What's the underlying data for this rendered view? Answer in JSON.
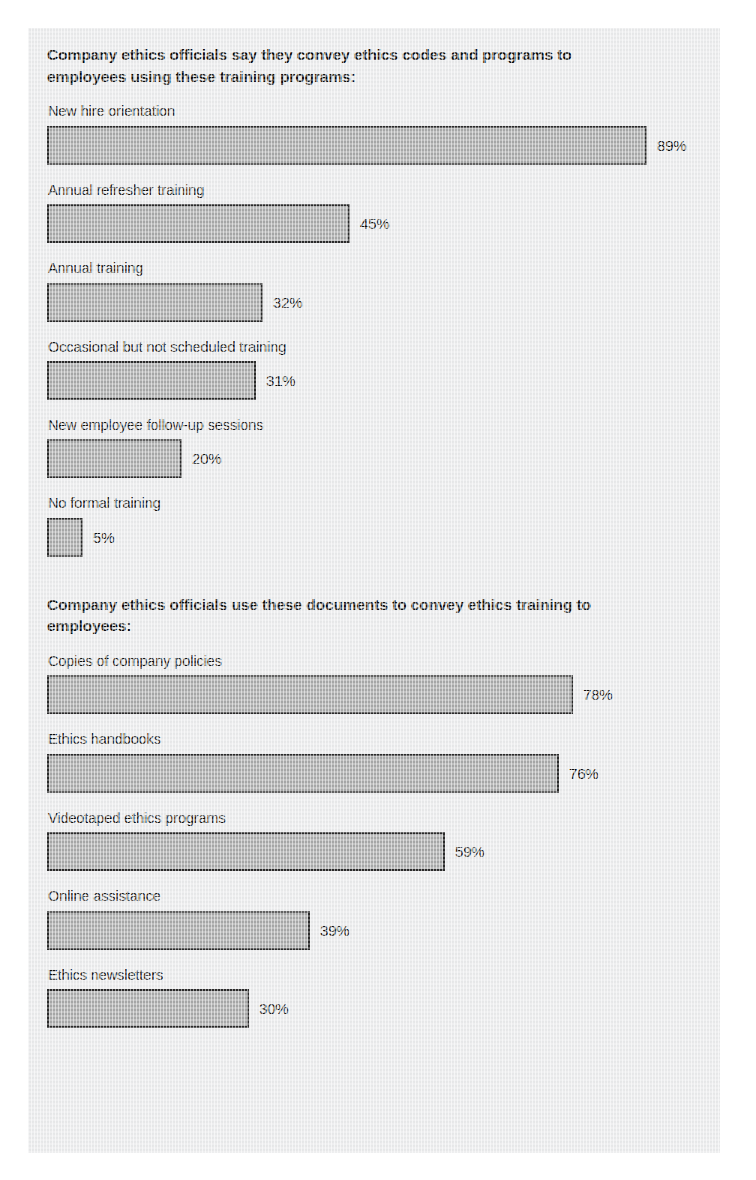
{
  "figure": {
    "background_color": "#ecedee",
    "bar_fill_color": "#a9aaaa",
    "bar_border_color": "#2a2a2a",
    "text_color": "#0f0f0f"
  },
  "sections": [
    {
      "heading": "Company ethics officials say they convey ethics codes and programs to employees using these training programs:",
      "items": [
        {
          "label": "New hire orientation",
          "value": 89,
          "value_text": "89%"
        },
        {
          "label": "Annual refresher training",
          "value": 45,
          "value_text": "45%"
        },
        {
          "label": "Annual training",
          "value": 32,
          "value_text": "32%"
        },
        {
          "label": "Occasional but not scheduled training",
          "value": 31,
          "value_text": "31%"
        },
        {
          "label": "New employee follow-up sessions",
          "value": 20,
          "value_text": "20%"
        },
        {
          "label": "No formal training",
          "value": 5,
          "value_text": "5%"
        }
      ]
    },
    {
      "heading": "Company ethics officials use these documents to convey ethics training to employees:",
      "items": [
        {
          "label": "Copies of company policies",
          "value": 78,
          "value_text": "78%"
        },
        {
          "label": "Ethics handbooks",
          "value": 76,
          "value_text": "76%"
        },
        {
          "label": "Videotaped ethics programs",
          "value": 59,
          "value_text": "59%"
        },
        {
          "label": "Online assistance",
          "value": 39,
          "value_text": "39%"
        },
        {
          "label": "Ethics newsletters",
          "value": 30,
          "value_text": "30%"
        }
      ]
    }
  ],
  "chart_data": [
    {
      "type": "bar",
      "orientation": "horizontal",
      "title": "Company ethics officials say they convey ethics codes and programs to employees using these training programs:",
      "xlabel": "",
      "ylabel": "",
      "xlim": [
        0,
        100
      ],
      "grid": false,
      "legend": "none",
      "units": "percent",
      "data_labels": true,
      "categories": [
        "New hire orientation",
        "Annual refresher training",
        "Annual training",
        "Occasional but not scheduled training",
        "New employee follow-up sessions",
        "No formal training"
      ],
      "values": [
        89,
        45,
        32,
        31,
        20,
        5
      ]
    },
    {
      "type": "bar",
      "orientation": "horizontal",
      "title": "Company ethics officials use these documents to convey ethics training to employees:",
      "xlabel": "",
      "ylabel": "",
      "xlim": [
        0,
        100
      ],
      "grid": false,
      "legend": "none",
      "units": "percent",
      "data_labels": true,
      "categories": [
        "Copies of company policies",
        "Ethics handbooks",
        "Videotaped ethics programs",
        "Online assistance",
        "Ethics newsletters"
      ],
      "values": [
        78,
        76,
        59,
        39,
        30
      ]
    }
  ]
}
